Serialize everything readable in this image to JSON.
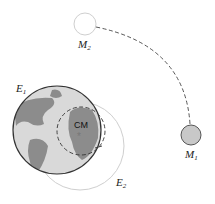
{
  "diagram": {
    "labels": {
      "earth1": {
        "main": "E",
        "sub": "1"
      },
      "earth2": {
        "main": "E",
        "sub": "2"
      },
      "moon1": {
        "main": "M",
        "sub": "1"
      },
      "moon2": {
        "main": "M",
        "sub": "2"
      },
      "center_of_mass": "CM",
      "cm_marker": "*"
    },
    "colors": {
      "earth_fill": "#d9d9d9",
      "continent": "#8c8c8c",
      "earth_outline": "#333333",
      "ghost_outline": "#cfcfcf",
      "dashed_path": "#444444",
      "moon_fill": "#c8c8c8"
    }
  }
}
